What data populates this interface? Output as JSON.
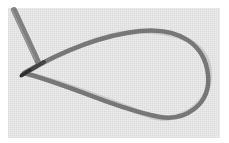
{
  "image": {
    "subject": "Embroidery thread loop (lazy daisy stitch) on woven fabric",
    "colors": {
      "background": "#ffffff",
      "fabric": "#ececec",
      "thread": "#7a7a7a",
      "thread_shadow": "#4a4a4a"
    }
  }
}
